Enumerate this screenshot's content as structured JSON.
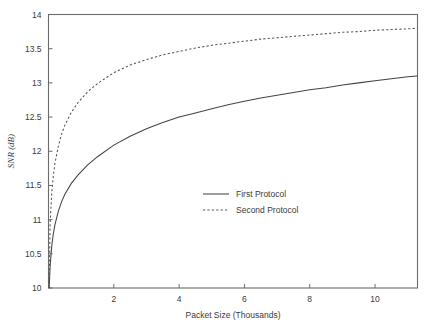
{
  "chart_data": {
    "type": "line",
    "title": "",
    "xlabel": "Packet Size (Thousands)",
    "ylabel": "SNR (dB)",
    "xlim": [
      0,
      11.3
    ],
    "ylim": [
      10,
      14
    ],
    "xticks": [
      2,
      4,
      6,
      8,
      10
    ],
    "xtick_labels": [
      "2",
      "4",
      "6",
      "8",
      "10"
    ],
    "yticks": [
      10,
      10.5,
      11,
      11.5,
      12,
      12.5,
      13,
      13.5,
      14
    ],
    "ytick_labels": [
      "10",
      "10.5",
      "11",
      "11.5",
      "12",
      "12.5",
      "13",
      "13.5",
      "14"
    ],
    "grid": false,
    "legend_position": "center",
    "series": [
      {
        "name": "First Protocol",
        "style": "solid",
        "color": "#444444",
        "x": [
          0.02,
          0.05,
          0.1,
          0.15,
          0.2,
          0.3,
          0.4,
          0.5,
          0.7,
          0.9,
          1.2,
          1.5,
          2.0,
          2.5,
          3.0,
          3.5,
          4.0,
          4.5,
          5.0,
          5.5,
          6.0,
          6.5,
          7.0,
          7.5,
          8.0,
          8.5,
          9.0,
          9.5,
          10.0,
          10.5,
          11.0,
          11.3
        ],
        "y": [
          10.0,
          10.32,
          10.62,
          10.8,
          10.93,
          11.12,
          11.26,
          11.37,
          11.53,
          11.65,
          11.8,
          11.92,
          12.09,
          12.22,
          12.33,
          12.42,
          12.5,
          12.56,
          12.62,
          12.68,
          12.73,
          12.78,
          12.82,
          12.86,
          12.9,
          12.93,
          12.97,
          13.0,
          13.03,
          13.06,
          13.09,
          13.1
        ]
      },
      {
        "name": "Second Protocol",
        "style": "dashed",
        "color": "#555555",
        "x": [
          0.02,
          0.05,
          0.1,
          0.15,
          0.2,
          0.3,
          0.4,
          0.5,
          0.7,
          0.9,
          1.2,
          1.5,
          2.0,
          2.5,
          3.0,
          3.5,
          4.0,
          4.5,
          5.0,
          5.5,
          6.0,
          6.5,
          7.0,
          7.5,
          8.0,
          8.5,
          9.0,
          9.5,
          10.0,
          10.5,
          11.0,
          11.3
        ],
        "y": [
          10.0,
          10.95,
          11.4,
          11.65,
          11.83,
          12.07,
          12.25,
          12.38,
          12.57,
          12.71,
          12.87,
          12.99,
          13.15,
          13.26,
          13.34,
          13.41,
          13.46,
          13.51,
          13.55,
          13.58,
          13.61,
          13.64,
          13.66,
          13.68,
          13.7,
          13.72,
          13.74,
          13.75,
          13.77,
          13.78,
          13.79,
          13.8
        ]
      }
    ],
    "legend": [
      {
        "label": "First Protocol",
        "style": "solid"
      },
      {
        "label": "Second Protocol",
        "style": "dashed"
      }
    ]
  }
}
